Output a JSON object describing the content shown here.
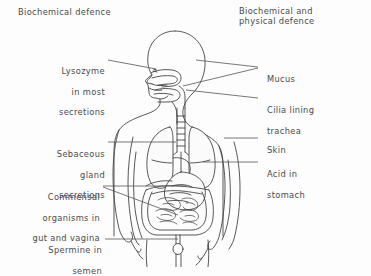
{
  "figure": {
    "kind": "biology-diagram",
    "background_color": "#fdfdfd",
    "line_color": "#3a3a3a",
    "text_color": "#4a4a4a"
  },
  "titles": {
    "left": "Biochemical defence",
    "right_line1": "Biochemical and",
    "right_line2": "physical defence"
  },
  "labels": {
    "lysozyme": {
      "line1": "Lysozyme",
      "line2": "in most",
      "line3": "secretions"
    },
    "sebaceous": {
      "line1": "Sebaceous",
      "line2": "gland",
      "line3": "secretions"
    },
    "commensal": {
      "line1": "Commensal",
      "line2": "organisms in",
      "line3": "gut and vagina"
    },
    "spermine": {
      "line1": "Spermine in",
      "line2": "semen"
    },
    "mucus": {
      "line1": "Mucus"
    },
    "cilia": {
      "line1": "Cilia lining",
      "line2": "trachea"
    },
    "skin": {
      "line1": "Skin"
    },
    "acid": {
      "line1": "Acid in",
      "line2": "stomach"
    }
  },
  "annotated_structures": [
    "nose and mouth secretions",
    "mucus in nasal cavity and airway",
    "cilia lining the trachea",
    "skin surface",
    "stomach",
    "sebaceous glands of the skin",
    "gut and vagina",
    "semen"
  ]
}
